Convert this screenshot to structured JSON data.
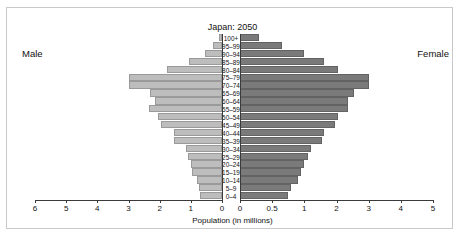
{
  "figure": {
    "title": "Japan: 2050",
    "male_label": "Male",
    "female_label": "Female",
    "xlabel": "Population (in millions)"
  },
  "chart_data": {
    "type": "bar",
    "subtype": "population-pyramid",
    "title": "Japan: 2050",
    "xlabel": "Population (in millions)",
    "ylabel": "",
    "units": "millions",
    "categories": [
      "100+",
      "95–99",
      "90–94",
      "85–89",
      "80–84",
      "75–79",
      "70–74",
      "65–69",
      "60–64",
      "55–59",
      "50–54",
      "45–49",
      "40–44",
      "35–39",
      "30–34",
      "25–29",
      "20–24",
      "15–19",
      "10–14",
      "5–9",
      "0–4"
    ],
    "legend": [
      "Male",
      "Female"
    ],
    "legend_position": "outside-left-and-right",
    "grid": false,
    "series": [
      {
        "name": "Male",
        "side": "left",
        "color": "#bdbdbd",
        "axis_ticks": [
          6,
          5,
          4,
          3,
          2,
          1,
          0
        ],
        "axis_tick_labels": [
          "6",
          "5",
          "4",
          "3",
          "2",
          "1",
          "0"
        ],
        "axis_range": [
          0,
          6
        ],
        "axis_scale": "linear",
        "values": [
          0.1,
          0.3,
          0.55,
          1.05,
          1.75,
          3.0,
          3.0,
          2.3,
          2.15,
          2.35,
          2.05,
          1.95,
          1.55,
          1.55,
          1.15,
          1.1,
          1.0,
          0.95,
          0.8,
          0.75,
          0.7
        ]
      },
      {
        "name": "Female",
        "side": "right",
        "color": "#7a7a7a",
        "axis_ticks": [
          0,
          0.5,
          1,
          2,
          3,
          4,
          5
        ],
        "axis_tick_labels": [
          "0",
          "0.5",
          "1",
          "2",
          "3",
          "4",
          "5"
        ],
        "axis_range": [
          0,
          5
        ],
        "axis_scale": "piecewise-linear",
        "values": [
          0.3,
          0.65,
          1.0,
          1.6,
          2.05,
          3.0,
          3.0,
          2.55,
          2.35,
          2.35,
          2.05,
          1.95,
          1.6,
          1.55,
          1.2,
          1.1,
          1.0,
          0.95,
          0.9,
          0.8,
          0.75
        ]
      }
    ]
  }
}
